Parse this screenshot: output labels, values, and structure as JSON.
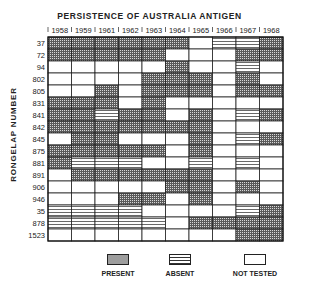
{
  "chart_data": {
    "type": "heatmap",
    "title": "PERSISTENCE OF AUSTRALIA ANTIGEN",
    "xlabel": "",
    "ylabel": "RONGELAP NUMBER",
    "columns": [
      "1958",
      "1959",
      "1961",
      "1962",
      "1963",
      "1964",
      "1965",
      "1966",
      "1967",
      "1968"
    ],
    "rows": [
      "37",
      "72",
      "94",
      "802",
      "805",
      "831",
      "841",
      "842",
      "845",
      "875",
      "881",
      "891",
      "906",
      "946",
      "35",
      "878",
      "1523"
    ],
    "status_codes": {
      "P": "PRESENT",
      "A": "ABSENT",
      "N": "NOT TESTED"
    },
    "values": [
      [
        "P",
        "P",
        "P",
        "P",
        "P",
        "P",
        "N",
        "A",
        "A",
        "P"
      ],
      [
        "P",
        "P",
        "P",
        "P",
        "P",
        "N",
        "N",
        "N",
        "P",
        "P"
      ],
      [
        "N",
        "N",
        "N",
        "N",
        "N",
        "P",
        "N",
        "N",
        "A",
        "N"
      ],
      [
        "N",
        "N",
        "N",
        "N",
        "P",
        "P",
        "P",
        "N",
        "P",
        "N"
      ],
      [
        "N",
        "N",
        "P",
        "N",
        "P",
        "P",
        "P",
        "N",
        "P",
        "P"
      ],
      [
        "P",
        "P",
        "P",
        "N",
        "P",
        "N",
        "N",
        "N",
        "N",
        "N"
      ],
      [
        "P",
        "P",
        "A",
        "P",
        "P",
        "N",
        "P",
        "N",
        "A",
        "P"
      ],
      [
        "P",
        "P",
        "P",
        "P",
        "P",
        "P",
        "P",
        "N",
        "N",
        "N"
      ],
      [
        "N",
        "P",
        "P",
        "N",
        "N",
        "N",
        "P",
        "N",
        "A",
        "P"
      ],
      [
        "P",
        "P",
        "P",
        "P",
        "P",
        "N",
        "P",
        "N",
        "N",
        "N"
      ],
      [
        "P",
        "A",
        "A",
        "A",
        "N",
        "N",
        "A",
        "N",
        "A",
        "N"
      ],
      [
        "N",
        "P",
        "P",
        "P",
        "P",
        "P",
        "P",
        "N",
        "N",
        "N"
      ],
      [
        "N",
        "N",
        "N",
        "N",
        "N",
        "P",
        "P",
        "N",
        "P",
        "N"
      ],
      [
        "N",
        "N",
        "N",
        "P",
        "P",
        "N",
        "P",
        "N",
        "N",
        "N"
      ],
      [
        "A",
        "A",
        "A",
        "A",
        "N",
        "N",
        "N",
        "N",
        "A",
        "P"
      ],
      [
        "A",
        "A",
        "A",
        "A",
        "A",
        "N",
        "P",
        "P",
        "P",
        "P"
      ],
      [
        "N",
        "N",
        "N",
        "N",
        "N",
        "N",
        "N",
        "N",
        "P",
        "P"
      ]
    ],
    "legend": [
      {
        "code": "P",
        "label": "PRESENT"
      },
      {
        "code": "A",
        "label": "ABSENT"
      },
      {
        "code": "N",
        "label": "NOT TESTED"
      }
    ],
    "legend_position": "bottom",
    "grid": true
  }
}
